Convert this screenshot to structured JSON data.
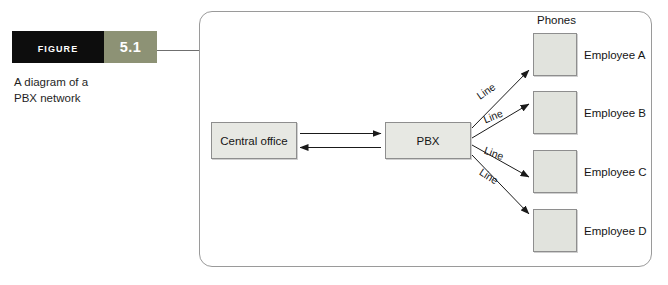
{
  "figure": {
    "tag_word": "Figure",
    "tag_number": "5.1",
    "caption_line1": "A diagram of a",
    "caption_line2": "PBX network",
    "tag_bg_dark": "#0d0d0d",
    "tag_bg_accent": "#8d9275"
  },
  "diagram": {
    "phones_header": "Phones",
    "nodes": [
      {
        "id": "central-office",
        "label": "Central office"
      },
      {
        "id": "pbx",
        "label": "PBX"
      }
    ],
    "phones": [
      {
        "employee": "Employee A",
        "line_label": "Line"
      },
      {
        "employee": "Employee B",
        "line_label": "Line"
      },
      {
        "employee": "Employee C",
        "line_label": "Line"
      },
      {
        "employee": "Employee D",
        "line_label": "Line"
      }
    ],
    "box_fill": "#e7e8e3",
    "box_stroke": "#8e8e8e",
    "frame_stroke": "#9a9a9a"
  }
}
